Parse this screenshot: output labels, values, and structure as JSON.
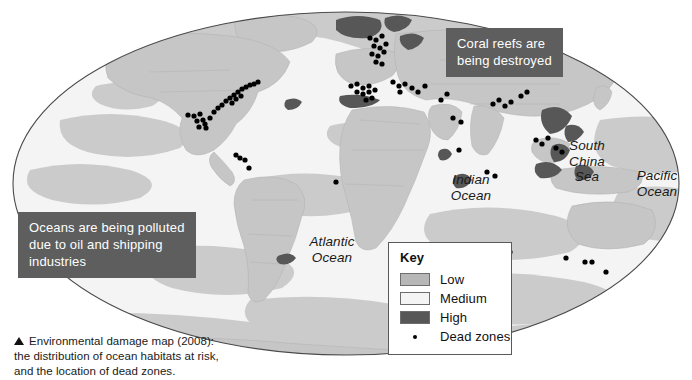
{
  "figure": {
    "caption_lines": [
      "Environmental damage map (2008):",
      "the distribution of ocean habitats at risk,",
      "and the location of dead zones."
    ],
    "caption_marker": "triangle-bullet"
  },
  "callouts": [
    {
      "id": "coral",
      "text": "Coral reefs are\nbeing destroyed",
      "background": "#5e5e5e",
      "text_color": "#ffffff"
    },
    {
      "id": "pollution",
      "text": "Oceans are being polluted\ndue to oil and shipping\nindustries",
      "background": "#5e5e5e",
      "text_color": "#ffffff"
    }
  ],
  "key": {
    "title": "Key",
    "items": [
      {
        "label": "Low",
        "swatch": "#b7b7b7",
        "type": "swatch"
      },
      {
        "label": "Medium",
        "swatch": "#f4f4f4",
        "type": "swatch"
      },
      {
        "label": "High",
        "swatch": "#575757",
        "type": "swatch"
      },
      {
        "label": "Dead zones",
        "swatch": "#000000",
        "type": "dot"
      }
    ]
  },
  "map": {
    "projection": "mollweide-ellipse",
    "ocean_labels": [
      {
        "name": "atlantic-ocean",
        "text": "Atlantic\nOcean"
      },
      {
        "name": "indian-ocean",
        "text": "Indian\nOcean"
      },
      {
        "name": "south-china-sea",
        "text": "South\nChina\nSea"
      },
      {
        "name": "pacific-ocean",
        "text": "Pacific\nOcean"
      }
    ],
    "colors": {
      "risk_low": "#b7b7b7",
      "risk_medium": "#f4f4f4",
      "risk_high": "#575757",
      "land": "#c9c9c9",
      "ocean_base": "#ededed",
      "outline": "#4a4a4a",
      "dead_zone": "#000000"
    },
    "dead_zone_count": 78
  },
  "chart_data": {
    "type": "map",
    "title": "Environmental damage map (2008)",
    "categories": [
      "Low",
      "Medium",
      "High",
      "Dead zones"
    ],
    "legend_position": "bottom-center",
    "dead_zones": [
      [
        188,
        115
      ],
      [
        194,
        116
      ],
      [
        200,
        114
      ],
      [
        197,
        121
      ],
      [
        203,
        120
      ],
      [
        205,
        124
      ],
      [
        199,
        127
      ],
      [
        206,
        128
      ],
      [
        210,
        118
      ],
      [
        214,
        112
      ],
      [
        218,
        108
      ],
      [
        222,
        105
      ],
      [
        226,
        101
      ],
      [
        230,
        98
      ],
      [
        234,
        95
      ],
      [
        238,
        92
      ],
      [
        242,
        89
      ],
      [
        246,
        87
      ],
      [
        250,
        85
      ],
      [
        254,
        84
      ],
      [
        258,
        82
      ],
      [
        241,
        96
      ],
      [
        236,
        99
      ],
      [
        232,
        103
      ],
      [
        236,
        155
      ],
      [
        240,
        158
      ],
      [
        245,
        160
      ],
      [
        249,
        168
      ],
      [
        370,
        38
      ],
      [
        376,
        40
      ],
      [
        382,
        36
      ],
      [
        374,
        46
      ],
      [
        380,
        48
      ],
      [
        386,
        44
      ],
      [
        372,
        54
      ],
      [
        378,
        56
      ],
      [
        384,
        52
      ],
      [
        376,
        62
      ],
      [
        382,
        64
      ],
      [
        351,
        86
      ],
      [
        357,
        84
      ],
      [
        363,
        88
      ],
      [
        369,
        86
      ],
      [
        357,
        92
      ],
      [
        363,
        94
      ],
      [
        369,
        92
      ],
      [
        375,
        90
      ],
      [
        366,
        100
      ],
      [
        372,
        98
      ],
      [
        393,
        82
      ],
      [
        399,
        86
      ],
      [
        405,
        84
      ],
      [
        400,
        92
      ],
      [
        412,
        88
      ],
      [
        418,
        92
      ],
      [
        425,
        86
      ],
      [
        447,
        94
      ],
      [
        441,
        100
      ],
      [
        453,
        118
      ],
      [
        461,
        122
      ],
      [
        459,
        150
      ],
      [
        493,
        104
      ],
      [
        499,
        100
      ],
      [
        505,
        106
      ],
      [
        511,
        102
      ],
      [
        521,
        96
      ],
      [
        527,
        92
      ],
      [
        536,
        140
      ],
      [
        542,
        144
      ],
      [
        548,
        138
      ],
      [
        556,
        148
      ],
      [
        562,
        152
      ],
      [
        487,
        172
      ],
      [
        495,
        176
      ],
      [
        510,
        252
      ],
      [
        566,
        258
      ],
      [
        585,
        262
      ],
      [
        592,
        262
      ],
      [
        606,
        272
      ],
      [
        419,
        250
      ],
      [
        336,
        182
      ]
    ]
  }
}
